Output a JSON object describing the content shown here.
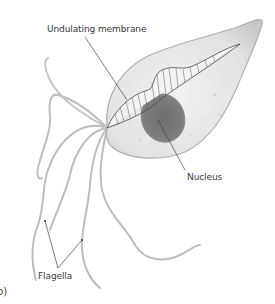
{
  "diagram": {
    "panel_label": "b)",
    "labels": {
      "undulating_membrane": "Undulating membrane",
      "nucleus": "Nucleus",
      "flagella": "Flagella"
    },
    "colors": {
      "cell_fill": "#e6e6e6",
      "cell_edge": "#b4b4b4",
      "nucleus": "#7a7a7a",
      "flagella": "#bcbcbc",
      "leader_line": "#444444",
      "text": "#3a3a3a"
    }
  }
}
